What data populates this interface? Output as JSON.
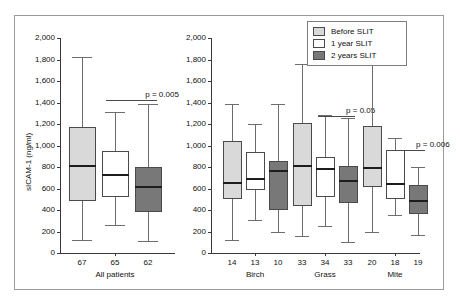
{
  "axis": {
    "ylabel": "sICAM-1 (ng/ml)",
    "yticks": [
      "0",
      "200",
      "400",
      "600",
      "800",
      "1,000",
      "1,200",
      "1,400",
      "1,600",
      "1,800",
      "2,000"
    ]
  },
  "legend": {
    "items": [
      {
        "label": "Before SLIT",
        "color": "#d9d9d9"
      },
      {
        "label": "1 year SLIT",
        "color": "#ffffff"
      },
      {
        "label": "2 years SLIT",
        "color": "#787878"
      }
    ]
  },
  "chart_data": {
    "type": "box",
    "title": "",
    "xlabel": "",
    "ylabel": "sICAM-1 (ng/ml)",
    "ylim": [
      0,
      2000
    ],
    "ytick_step": 200,
    "grid": false,
    "legend_position": "top-right",
    "series": [
      {
        "name": "Before SLIT",
        "color": "#d9d9d9"
      },
      {
        "name": "1 year SLIT",
        "color": "#ffffff"
      },
      {
        "name": "2 years SLIT",
        "color": "#787878"
      }
    ],
    "panels": [
      {
        "name": "All patients",
        "group_label": "All patients",
        "boxes": [
          {
            "series": "Before SLIT",
            "n": "67",
            "whisker_low": 125,
            "q1": 485,
            "median": 805,
            "q3": 1170,
            "whisker_high": 1820
          },
          {
            "series": "1 year SLIT",
            "n": "65",
            "whisker_low": 260,
            "q1": 520,
            "median": 725,
            "q3": 945,
            "whisker_high": 1310
          },
          {
            "series": "2 years SLIT",
            "n": "62",
            "whisker_low": 115,
            "q1": 385,
            "median": 615,
            "q3": 800,
            "whisker_high": 1385
          }
        ],
        "annotations": [
          {
            "text": "p = 0.005",
            "from": "1 year SLIT",
            "to": "2 years SLIT",
            "y": 1420
          }
        ]
      },
      {
        "name": "Birch",
        "group_label": "Birch",
        "boxes": [
          {
            "series": "Before SLIT",
            "n": "14",
            "whisker_low": 125,
            "q1": 500,
            "median": 650,
            "q3": 1040,
            "whisker_high": 1385
          },
          {
            "series": "1 year SLIT",
            "n": "13",
            "whisker_low": 310,
            "q1": 590,
            "median": 690,
            "q3": 940,
            "whisker_high": 1200
          },
          {
            "series": "2 years SLIT",
            "n": "10",
            "whisker_low": 195,
            "q1": 400,
            "median": 765,
            "q3": 860,
            "whisker_high": 1390
          }
        ],
        "annotations": []
      },
      {
        "name": "Grass",
        "group_label": "Grass",
        "boxes": [
          {
            "series": "Before SLIT",
            "n": "33",
            "whisker_low": 160,
            "q1": 440,
            "median": 805,
            "q3": 1210,
            "whisker_high": 1755
          },
          {
            "series": "1 year SLIT",
            "n": "34",
            "whisker_low": 250,
            "q1": 525,
            "median": 780,
            "q3": 895,
            "whisker_high": 1285
          },
          {
            "series": "2 years SLIT",
            "n": "33",
            "whisker_low": 105,
            "q1": 465,
            "median": 670,
            "q3": 805,
            "whisker_high": 1255
          }
        ],
        "annotations": [
          {
            "text": "p = 0.05",
            "from": "1 year SLIT",
            "to": "2 years SLIT",
            "y": 1275
          }
        ]
      },
      {
        "name": "Mite",
        "group_label": "Mite",
        "boxes": [
          {
            "series": "Before SLIT",
            "n": "20",
            "whisker_low": 195,
            "q1": 615,
            "median": 795,
            "q3": 1180,
            "whisker_high": 1820
          },
          {
            "series": "1 year SLIT",
            "n": "18",
            "whisker_low": 350,
            "q1": 505,
            "median": 640,
            "q3": 960,
            "whisker_high": 1070
          },
          {
            "series": "2 years SLIT",
            "n": "19",
            "whisker_low": 165,
            "q1": 365,
            "median": 480,
            "q3": 635,
            "whisker_high": 800
          }
        ],
        "annotations": [
          {
            "text": "p = 0.006",
            "from": "1 year SLIT",
            "to": "2 years SLIT",
            "y": 960
          }
        ]
      }
    ]
  }
}
